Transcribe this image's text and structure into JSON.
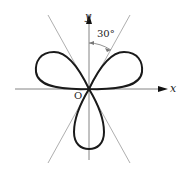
{
  "figure": {
    "type": "three-petal rose curve with asymptote lines",
    "axis_x_label": "x",
    "axis_y_label": "y",
    "origin_label": "O",
    "angle_label": "30°",
    "curve_color": "#1a1a1a",
    "line_color": "#888888"
  }
}
